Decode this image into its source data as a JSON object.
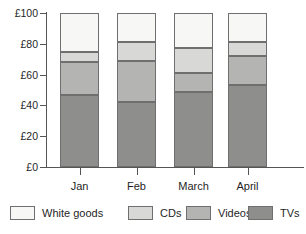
{
  "chart_data": {
    "type": "bar",
    "stacked": true,
    "title": "",
    "subtitle": "",
    "xlabel": "",
    "ylabel": "",
    "categories": [
      "Jan",
      "Feb",
      "March",
      "April"
    ],
    "ylim": [
      0,
      100
    ],
    "ytick_values": [
      0,
      20,
      40,
      60,
      80,
      100
    ],
    "ytick_labels": [
      "£0",
      "£20",
      "£40",
      "£60",
      "£80",
      "£100"
    ],
    "currency_symbol": "£",
    "grid": false,
    "legend_position": "bottom",
    "stack_order_bottom_to_top": [
      "TVs",
      "Videos",
      "CDs",
      "White goods"
    ],
    "series": [
      {
        "name": "TVs",
        "color": "#8e8e8c",
        "values": [
          47,
          42,
          49,
          53
        ]
      },
      {
        "name": "Videos",
        "color": "#b4b4b2",
        "values": [
          21,
          27,
          12,
          19
        ]
      },
      {
        "name": "CDs",
        "color": "#d8d8d6",
        "values": [
          7,
          12,
          16,
          9
        ]
      },
      {
        "name": "White goods",
        "color": "#f7f7f5",
        "values": [
          25,
          19,
          23,
          19
        ]
      }
    ],
    "cumulative_tops": {
      "TVs": [
        47,
        42,
        49,
        53
      ],
      "Videos": [
        68,
        69,
        61,
        72
      ],
      "CDs": [
        75,
        81,
        77,
        81
      ],
      "White goods": [
        100,
        100,
        100,
        100
      ]
    },
    "annotations": []
  },
  "legend": {
    "items": [
      {
        "label": "White goods",
        "color": "#f7f7f5"
      },
      {
        "label": "CDs",
        "color": "#d8d8d6"
      },
      {
        "label": "Videos",
        "color": "#b4b4b2"
      },
      {
        "label": "TVs",
        "color": "#8e8e8c"
      }
    ]
  },
  "axis": {
    "line_color": "#555555",
    "text_color": "#1f1f1f"
  }
}
